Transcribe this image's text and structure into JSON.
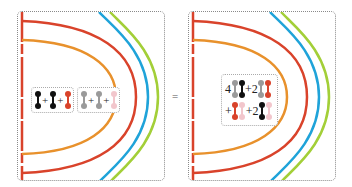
{
  "equals_sign": "=",
  "colors": {
    "red": "#d9432b",
    "orange": "#e8912c",
    "blue": "#1fa3d9",
    "green": "#a3cf38",
    "black": "#111111",
    "gray": "#9a9a9a",
    "pink": "#f2c6cc"
  },
  "left_panel": {
    "box1": {
      "items": [
        "black",
        "+",
        "black",
        "+",
        "red"
      ]
    },
    "box2": {
      "items": [
        "gray",
        "+",
        "gray",
        "+",
        "pink"
      ]
    }
  },
  "right_panel": {
    "row1": {
      "coef1": "4",
      "plus1": "+2"
    },
    "row2": {
      "plus0": "+",
      "plus1": "+2"
    }
  }
}
